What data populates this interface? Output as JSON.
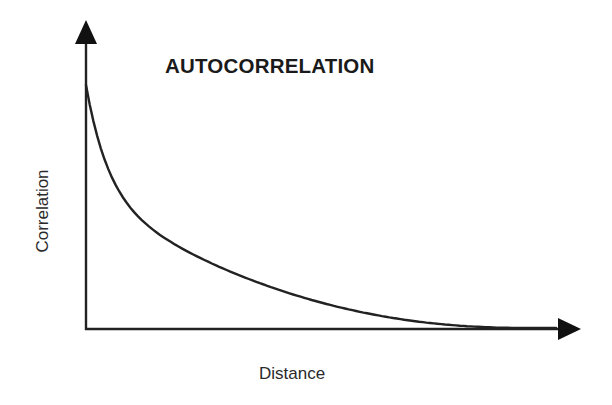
{
  "chart_data": {
    "type": "line",
    "title": "AUTOCORRELATION",
    "xlabel": "Distance",
    "ylabel": "Correlation",
    "grid": false,
    "legend": null,
    "ticks": {
      "x": [],
      "y": []
    },
    "series": [
      {
        "name": "autocorrelation",
        "description": "Monotonically decreasing convex curve starting high at zero distance and asymptotically approaching zero",
        "x": [
          0,
          0.05,
          0.1,
          0.2,
          0.3,
          0.4,
          0.5,
          0.6,
          0.7,
          0.8,
          0.9,
          1.0
        ],
        "values": [
          1.0,
          0.72,
          0.56,
          0.38,
          0.26,
          0.17,
          0.11,
          0.06,
          0.03,
          0.01,
          0.0,
          0.0
        ]
      }
    ],
    "xlim": [
      0,
      1
    ],
    "ylim": [
      0,
      1
    ]
  },
  "colors": {
    "line": "#222222",
    "axes": "#222222",
    "background": "#ffffff"
  }
}
